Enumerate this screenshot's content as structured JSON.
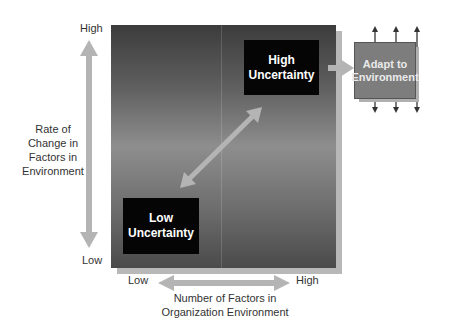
{
  "diagram": {
    "y_axis": {
      "high_label": "High",
      "low_label": "Low",
      "title": [
        "Rate of",
        "Change in",
        "Factors in",
        "Environment"
      ]
    },
    "x_axis": {
      "low_label": "Low",
      "high_label": "High",
      "title": [
        "Number of Factors in",
        "Organization Environment"
      ]
    },
    "boxes": {
      "high": [
        "High",
        "Uncertainty"
      ],
      "low": [
        "Low",
        "Uncertainty"
      ],
      "adapt": [
        "Adapt to",
        "Environment"
      ]
    },
    "colors": {
      "arrow": "#b4b4b4",
      "box": "#050505",
      "adapt_box": "#7d7d7d",
      "small_arrows": "#333333"
    }
  }
}
